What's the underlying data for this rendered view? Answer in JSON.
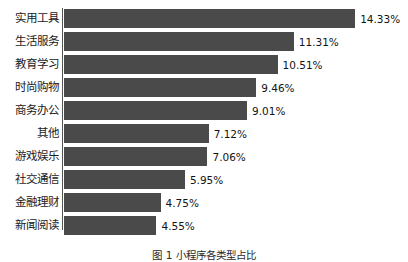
{
  "chart_data": {
    "type": "bar",
    "orientation": "horizontal",
    "title": "",
    "subtitle": "",
    "xlabel": "",
    "ylabel": "",
    "grid": false,
    "legend": null,
    "legend_position": "none",
    "xlim": [
      0,
      14.33
    ],
    "value_suffix": "%",
    "bar_color": "#4a4a4a",
    "axis_color": "#545454",
    "categories": [
      "实用工具",
      "生活服务",
      "教育学习",
      "时尚购物",
      "商务办公",
      "其他",
      "游戏娱乐",
      "社交通信",
      "金融理财",
      "新闻阅读"
    ],
    "values": [
      14.33,
      11.31,
      10.51,
      9.46,
      9.01,
      7.12,
      7.06,
      5.95,
      4.75,
      4.55
    ],
    "value_labels": [
      "14.33%",
      "11.31%",
      "10.51%",
      "9.46%",
      "9.01%",
      "7.12%",
      "7.06%",
      "5.95%",
      "4.75%",
      "4.55%"
    ],
    "bars": [
      {
        "category": "实用工具",
        "value": 14.33,
        "label": "14.33%"
      },
      {
        "category": "生活服务",
        "value": 11.31,
        "label": "11.31%"
      },
      {
        "category": "教育学习",
        "value": 10.51,
        "label": "10.51%"
      },
      {
        "category": "时尚购物",
        "value": 9.46,
        "label": "9.46%"
      },
      {
        "category": "商务办公",
        "value": 9.01,
        "label": "9.01%"
      },
      {
        "category": "其他",
        "value": 7.12,
        "label": "7.12%"
      },
      {
        "category": "游戏娱乐",
        "value": 7.06,
        "label": "7.06%"
      },
      {
        "category": "社交通信",
        "value": 5.95,
        "label": "5.95%"
      },
      {
        "category": "金融理财",
        "value": 4.75,
        "label": "4.75%"
      },
      {
        "category": "新闻阅读",
        "value": 4.55,
        "label": "4.55%"
      }
    ]
  },
  "caption": {
    "text": "图 1    小程序各类型占比"
  }
}
